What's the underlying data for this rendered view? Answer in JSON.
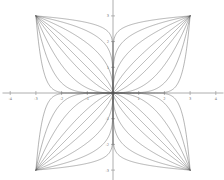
{
  "figure": {
    "background_color": "#ffffff",
    "axis_color": "#9a9a9a",
    "curve_color": "#5a5a5a",
    "tick_label_color": "#7a7a7a",
    "origin_px": {
      "x": 113,
      "y": 93
    },
    "pixels_per_unit": 25.7
  },
  "axes": {
    "x_axis_name": "x-axis",
    "y_axis_name": "y-axis",
    "xlim": [
      -4.3,
      4.3
    ],
    "ylim": [
      -4.3,
      4.3
    ],
    "grid": false,
    "xticks": [
      -4,
      -3,
      -2,
      -1,
      0,
      1,
      2,
      3,
      4
    ],
    "yticks": [
      -4,
      -3,
      -2,
      -1,
      0,
      1,
      2,
      3,
      4
    ],
    "xtick_labels": [
      "-4",
      "-3",
      "-2",
      "-1",
      "0",
      "1",
      "2",
      "3",
      "4"
    ],
    "ytick_labels": [
      "-4",
      "-3",
      "-2",
      "-1",
      "0",
      "1",
      "2",
      "3",
      "4"
    ]
  },
  "chart_data": {
    "type": "line",
    "title": "",
    "subtitle": "",
    "xlabel": "",
    "ylabel": "",
    "xlim": [
      -4.3,
      4.3
    ],
    "ylim": [
      -4.3,
      4.3
    ],
    "grid": false,
    "legend": "none",
    "corner_extent": 3,
    "exponents": [
      0.0833,
      0.2,
      0.4,
      0.7,
      1.0,
      1.43,
      2.5,
      5.0,
      12.0
    ],
    "quadrant_signs": [
      {
        "sx": 1,
        "sy": 1
      },
      {
        "sx": -1,
        "sy": 1
      },
      {
        "sx": -1,
        "sy": -1
      },
      {
        "sx": 1,
        "sy": -1
      }
    ],
    "annotations": []
  }
}
